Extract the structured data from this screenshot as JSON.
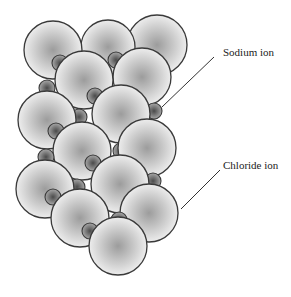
{
  "diagram": {
    "type": "crystal-lattice",
    "labels": [
      {
        "id": "sodium",
        "text": "Sodium ion",
        "x": 223,
        "y": 53,
        "line": [
          214,
          57,
          162,
          107
        ]
      },
      {
        "id": "chloride",
        "text": "Chloride ion",
        "x": 223,
        "y": 166,
        "line": [
          220,
          170,
          181,
          209
        ]
      }
    ],
    "colors": {
      "chloride_fill_center": "#9c9c9c",
      "chloride_fill_edge": "#ededed",
      "sodium_fill_center": "#4a4a4a",
      "sodium_fill_edge": "#a8a8a8",
      "stroke": "#3a3a3a"
    },
    "chloride_ions": [
      {
        "cx": 53,
        "cy": 50,
        "r": 29
      },
      {
        "cx": 108,
        "cy": 47,
        "r": 27
      },
      {
        "cx": 157,
        "cy": 45,
        "r": 30
      },
      {
        "cx": 47,
        "cy": 120,
        "r": 29
      },
      {
        "cx": 84,
        "cy": 80,
        "r": 29
      },
      {
        "cx": 142,
        "cy": 77,
        "r": 29
      },
      {
        "cx": 147,
        "cy": 148,
        "r": 29
      },
      {
        "cx": 82,
        "cy": 151,
        "r": 29
      },
      {
        "cx": 45,
        "cy": 189,
        "r": 29
      },
      {
        "cx": 149,
        "cy": 213,
        "r": 29
      },
      {
        "cx": 80,
        "cy": 218,
        "r": 29
      },
      {
        "cx": 121,
        "cy": 114,
        "r": 29
      },
      {
        "cx": 120,
        "cy": 184,
        "r": 29
      },
      {
        "cx": 118,
        "cy": 246,
        "r": 29
      }
    ],
    "sodium_ions": [
      {
        "cx": 60,
        "cy": 63,
        "r": 8
      },
      {
        "cx": 116,
        "cy": 60,
        "r": 8
      },
      {
        "cx": 47,
        "cy": 88,
        "r": 8
      },
      {
        "cx": 95,
        "cy": 96,
        "r": 8
      },
      {
        "cx": 154,
        "cy": 111,
        "r": 8
      },
      {
        "cx": 79,
        "cy": 117,
        "r": 8
      },
      {
        "cx": 56,
        "cy": 131,
        "r": 8
      },
      {
        "cx": 121,
        "cy": 151,
        "r": 8
      },
      {
        "cx": 93,
        "cy": 163,
        "r": 8
      },
      {
        "cx": 46,
        "cy": 157,
        "r": 8
      },
      {
        "cx": 77,
        "cy": 187,
        "r": 8
      },
      {
        "cx": 153,
        "cy": 181,
        "r": 8
      },
      {
        "cx": 53,
        "cy": 197,
        "r": 8
      },
      {
        "cx": 119,
        "cy": 220,
        "r": 8
      },
      {
        "cx": 90,
        "cy": 231,
        "r": 8
      }
    ]
  }
}
